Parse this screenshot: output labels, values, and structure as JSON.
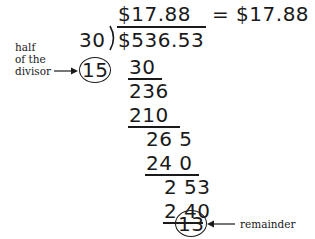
{
  "diagram": {
    "quotient": "$17.88",
    "equals_result": "= $17.88",
    "divisor": "30",
    "dividend": "$536.53",
    "half_divisor": "15",
    "half_divisor_label_lines": [
      "half",
      "of the",
      "divisor"
    ],
    "steps": [
      "30",
      "236",
      "210",
      "26 5",
      "24 0",
      "2 53",
      "2 40"
    ],
    "remainder": "13",
    "remainder_label": "remainder"
  }
}
